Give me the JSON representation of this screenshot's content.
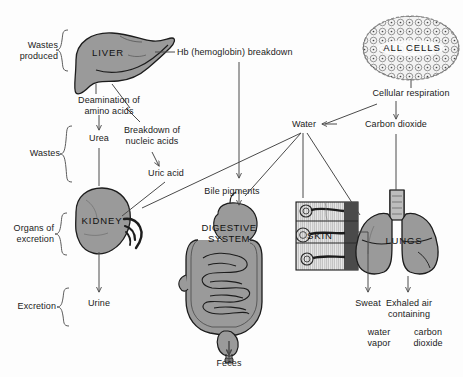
{
  "figure": {
    "background_color": "#fdfdfd",
    "organ_fill_color": "#9a9a9a",
    "line_color": "#4a4a4a"
  },
  "brackets": [
    {
      "id": "wastes-produced",
      "label": "Wastes\nproduced"
    },
    {
      "id": "wastes",
      "label": "Wastes"
    },
    {
      "id": "organs-of-excretion",
      "label": "Organs of\nexcretion"
    },
    {
      "id": "excretion",
      "label": "Excretion"
    }
  ],
  "organs": [
    {
      "id": "liver",
      "label": "LIVER"
    },
    {
      "id": "kidney",
      "label": "KIDNEY"
    },
    {
      "id": "digestive-system",
      "label": "DIGESTIVE\nSYSTEM"
    },
    {
      "id": "skin",
      "label": "SKIN"
    },
    {
      "id": "lungs",
      "label": "LUNGS"
    },
    {
      "id": "all-cells",
      "label": "ALL CELLS"
    }
  ],
  "processes": [
    {
      "id": "hb-breakdown",
      "label": "Hb (hemoglobin) breakdown"
    },
    {
      "id": "deamination",
      "label": "Deamination of\namino acids"
    },
    {
      "id": "nucleic-acid-breakdown",
      "label": "Breakdown of\nnucleic acids"
    },
    {
      "id": "cellular-respiration",
      "label": "Cellular respiration"
    }
  ],
  "substances": [
    {
      "id": "urea",
      "label": "Urea"
    },
    {
      "id": "uric-acid",
      "label": "Uric acid"
    },
    {
      "id": "bile-pigments",
      "label": "Bile pigments"
    },
    {
      "id": "water",
      "label": "Water"
    },
    {
      "id": "carbon-dioxide",
      "label": "Carbon dioxide"
    }
  ],
  "excretions": [
    {
      "id": "urine",
      "label": "Urine"
    },
    {
      "id": "feces",
      "label": "Feces"
    },
    {
      "id": "sweat",
      "label": "Sweat"
    },
    {
      "id": "exhaled-air",
      "label": "Exhaled air\ncontaining"
    },
    {
      "id": "water-vapor",
      "label": "water\nvapor"
    },
    {
      "id": "exhaled-carbon-dioxide",
      "label": "carbon\ndioxide"
    }
  ]
}
